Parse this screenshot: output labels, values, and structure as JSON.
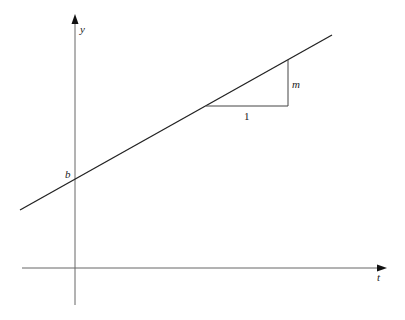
{
  "diagram": {
    "type": "slope-intercept line diagram",
    "axes": {
      "vertical_label": "y",
      "horizontal_label": "t"
    },
    "intercept_label": "b",
    "slope_triangle": {
      "run_label": "1",
      "rise_label": "m"
    },
    "colors": {
      "axis": "#555555",
      "line": "#222222",
      "background": "#ffffff"
    }
  }
}
